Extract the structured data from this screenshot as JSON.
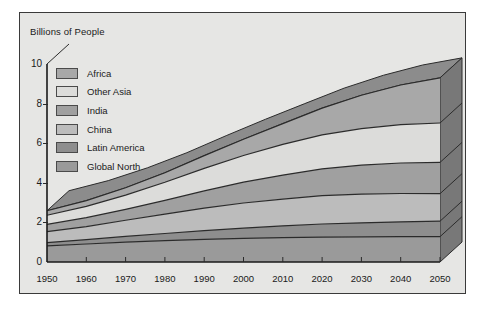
{
  "chart_data": {
    "type": "area",
    "title": "",
    "ylabel": "Billions of People",
    "xlabel": "",
    "stacked": true,
    "grid": false,
    "legend_position": "inside-top-left",
    "xlim": [
      1950,
      2050
    ],
    "ylim": [
      0,
      10
    ],
    "yticks": [
      0,
      2,
      4,
      6,
      8,
      10
    ],
    "x": [
      1950,
      1960,
      1970,
      1980,
      1990,
      2000,
      2010,
      2020,
      2030,
      2040,
      2050
    ],
    "xticks": [
      1950,
      1960,
      1970,
      1980,
      1990,
      2000,
      2010,
      2020,
      2030,
      2040,
      2050
    ],
    "series": [
      {
        "name": "Global North",
        "color": "#9a9a9a",
        "values": [
          0.81,
          0.91,
          1.0,
          1.08,
          1.14,
          1.19,
          1.23,
          1.26,
          1.27,
          1.28,
          1.28
        ]
      },
      {
        "name": "Latin America",
        "color": "#8e8e8e",
        "values": [
          0.17,
          0.22,
          0.29,
          0.36,
          0.44,
          0.52,
          0.59,
          0.66,
          0.71,
          0.75,
          0.78
        ]
      },
      {
        "name": "China",
        "color": "#bcbcbc",
        "values": [
          0.55,
          0.66,
          0.82,
          0.98,
          1.14,
          1.27,
          1.36,
          1.43,
          1.45,
          1.43,
          1.39
        ]
      },
      {
        "name": "India",
        "color": "#a0a0a0",
        "values": [
          0.37,
          0.45,
          0.55,
          0.69,
          0.87,
          1.05,
          1.21,
          1.35,
          1.46,
          1.54,
          1.58
        ]
      },
      {
        "name": "Other Asia",
        "color": "#dcdcda",
        "values": [
          0.46,
          0.57,
          0.72,
          0.92,
          1.14,
          1.35,
          1.55,
          1.72,
          1.85,
          1.94,
          1.99
        ]
      },
      {
        "name": "Africa",
        "color": "#a8a8a8",
        "values": [
          0.23,
          0.29,
          0.37,
          0.48,
          0.64,
          0.82,
          1.05,
          1.35,
          1.68,
          2.0,
          2.28
        ]
      }
    ],
    "totals": [
      2.59,
      3.1,
      3.75,
      4.51,
      5.37,
      6.2,
      6.99,
      7.77,
      8.42,
      8.94,
      9.3
    ],
    "annotations": []
  },
  "legend": {
    "items": [
      {
        "label": "Africa",
        "color": "#a8a8a8"
      },
      {
        "label": "Other Asia",
        "color": "#dcdcda"
      },
      {
        "label": "India",
        "color": "#a0a0a0"
      },
      {
        "label": "China",
        "color": "#bcbcbc"
      },
      {
        "label": "Latin America",
        "color": "#8e8e8e"
      },
      {
        "label": "Global North",
        "color": "#9a9a9a"
      }
    ]
  },
  "axis": {
    "y_title": "Billions of People",
    "y_ticks": [
      "10",
      "8",
      "6",
      "4",
      "2",
      "0"
    ],
    "x_ticks": [
      "1950",
      "1960",
      "1970",
      "1980",
      "1990",
      "2000",
      "2010",
      "2020",
      "2030",
      "2040",
      "2050"
    ]
  },
  "style": {
    "frame_fill": "#e6e6e4",
    "frame_border": "#3a3a3a",
    "top_face": "#8c8c8c",
    "side_face": "#787878",
    "line_color": "#2b2b2b",
    "text_color": "#1a1a1a"
  }
}
